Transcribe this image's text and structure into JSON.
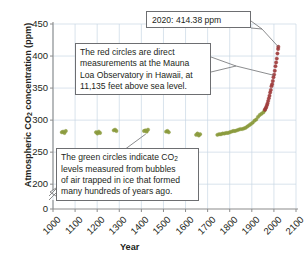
{
  "chart_data": {
    "type": "scatter",
    "title": "",
    "xlabel": "Year",
    "ylabel": "Atmospheric CO2 concentration (ppm)",
    "ylabel_rich": "Atmospheric CO₂ concentration (ppm)",
    "xlim": [
      1000,
      2100
    ],
    "ylim": [
      180,
      450
    ],
    "y_axis_break": true,
    "grid": true,
    "legend": "none",
    "x_ticks": [
      "1000",
      "1100",
      "1200",
      "1300",
      "1400",
      "1500",
      "1600",
      "1700",
      "1800",
      "1900",
      "2000",
      "2100"
    ],
    "y_ticks": [
      "0",
      "200",
      "250",
      "300",
      "350",
      "400",
      "450"
    ],
    "series": [
      {
        "name": "Ice core bubbles (green circles)",
        "color": "#8a9a3c",
        "marker": "circle",
        "points": [
          [
            1040,
            281
          ],
          [
            1046,
            282
          ],
          [
            1052,
            280
          ],
          [
            1058,
            283
          ],
          [
            1195,
            281
          ],
          [
            1201,
            279
          ],
          [
            1207,
            282
          ],
          [
            1213,
            280
          ],
          [
            1275,
            284
          ],
          [
            1281,
            285
          ],
          [
            1287,
            283
          ],
          [
            1412,
            283
          ],
          [
            1418,
            284
          ],
          [
            1424,
            282
          ],
          [
            1430,
            285
          ],
          [
            1512,
            282
          ],
          [
            1518,
            283
          ],
          [
            1524,
            281
          ],
          [
            1648,
            277
          ],
          [
            1654,
            279
          ],
          [
            1660,
            276
          ],
          [
            1666,
            278
          ],
          [
            1744,
            277
          ],
          [
            1752,
            278
          ],
          [
            1760,
            278
          ],
          [
            1768,
            279
          ],
          [
            1776,
            279
          ],
          [
            1784,
            280
          ],
          [
            1792,
            280
          ],
          [
            1800,
            281
          ],
          [
            1808,
            282
          ],
          [
            1816,
            283
          ],
          [
            1824,
            283
          ],
          [
            1832,
            284
          ],
          [
            1840,
            285
          ],
          [
            1848,
            286
          ],
          [
            1856,
            286
          ],
          [
            1864,
            287
          ],
          [
            1872,
            288
          ],
          [
            1880,
            290
          ],
          [
            1888,
            292
          ],
          [
            1896,
            294
          ],
          [
            1904,
            296
          ],
          [
            1912,
            299
          ],
          [
            1920,
            301
          ],
          [
            1928,
            305
          ],
          [
            1936,
            308
          ],
          [
            1944,
            310
          ],
          [
            1952,
            312
          ],
          [
            1958,
            315
          ]
        ]
      },
      {
        "name": "Mauna Loa direct measurements (red circles)",
        "color": "#9e3b3b",
        "marker": "circle",
        "points": [
          [
            1959,
            316
          ],
          [
            1962,
            318
          ],
          [
            1965,
            320
          ],
          [
            1968,
            323
          ],
          [
            1971,
            326
          ],
          [
            1974,
            330
          ],
          [
            1977,
            334
          ],
          [
            1980,
            338
          ],
          [
            1983,
            343
          ],
          [
            1986,
            347
          ],
          [
            1989,
            353
          ],
          [
            1992,
            356
          ],
          [
            1995,
            361
          ],
          [
            1998,
            367
          ],
          [
            2001,
            371
          ],
          [
            2004,
            377
          ],
          [
            2007,
            384
          ],
          [
            2010,
            390
          ],
          [
            2013,
            396
          ],
          [
            2016,
            404
          ],
          [
            2019,
            411
          ],
          [
            2020,
            414.38
          ]
        ]
      }
    ],
    "annotations": [
      {
        "id": "callout-2020",
        "text": "2020: 414.38 ppm",
        "points_to_year": 2020,
        "points_to_value": 414.38
      },
      {
        "id": "callout-red",
        "text": "The red circles are direct measurements at the Mauna Loa Observatory in Hawaii, at 11,135 feet above sea level.",
        "points_to_year": 2000,
        "points_to_value": 370
      },
      {
        "id": "callout-green",
        "text": "The green circles indicate CO2 levels measured from bubbles of air trapped in ice that formed many hundreds of years ago.",
        "text_rich": "The green circles indicate CO₂ levels measured from bubbles of air trapped in ice that formed many hundreds of years ago.",
        "points_to_year": 1420,
        "points_to_value": 283
      }
    ],
    "colors": {
      "grid": "#c9d7e4",
      "axis": "#8c8c8c",
      "text": "#231f20",
      "callout_border": "#6d6e71",
      "green_series": "#8a9a3c",
      "red_series": "#9e3b3b",
      "background": "#ffffff"
    }
  },
  "axis": {
    "y_title_part1": "Atmospheric CO",
    "y_title_sub": "2",
    "y_title_part2": " concentration (ppm)",
    "x_title": "Year"
  },
  "annotations": {
    "box_2020": {
      "line1": "2020: 414.38 ppm"
    },
    "box_red": {
      "line1": "The red circles are direct",
      "line2": "measurements at the Mauna",
      "line3": "Loa Observatory in Hawaii, at",
      "line4": "11,135 feet above sea level."
    },
    "box_green": {
      "line1_a": "The green circles indicate CO",
      "line1_sub": "2",
      "line2": "levels measured from bubbles",
      "line3": "of air trapped in ice that formed",
      "line4": "many hundreds of years ago."
    }
  }
}
